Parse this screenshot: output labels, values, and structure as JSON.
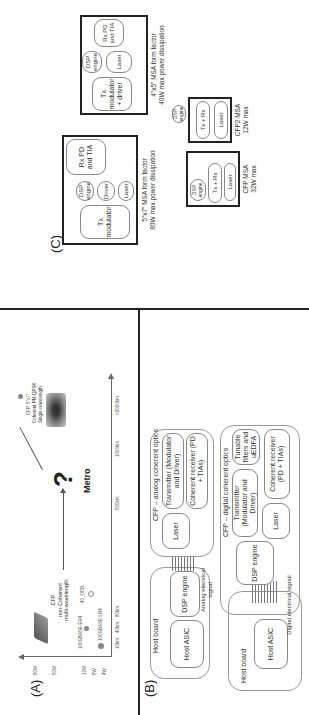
{
  "panels": {
    "a": {
      "label": "(A)",
      "y_ticks": [
        "80W",
        "50W",
        "12W",
        "8W",
        "4W"
      ],
      "x_ticks": [
        "10km",
        "40km",
        "80km",
        "500km",
        "1000km",
        ">2000km"
      ],
      "points": {
        "cfp_noncoherent": "CFP\nnon-Coherent\nmulti-wavelength",
        "lr4_100g": "100GBASE-LR4",
        "er4_100g": "100GBASE-ER4",
        "ocb": "40_OCB",
        "cfp_coherent_a": "CFP, 5\"x7\"",
        "cfp_coherent_b": "Coherent PM-QPSK",
        "cfp_coherent_c": "Single-wavelength"
      },
      "question_mark": "?",
      "metro_label": "Metro"
    },
    "b": {
      "label": "(B)",
      "analog": {
        "host_board": "Host board",
        "host_asic": "Host ASIC",
        "dsp_engine": "DSP engine",
        "signal": "Analog electrical signal",
        "module_title": "CFP – analog coherent optics",
        "laser": "Laser",
        "transmitter": "Transmitter (Modulator and Driver)",
        "receiver": "Coherent receiver (PD + TIAs)"
      },
      "digital": {
        "host_board": "Host board",
        "host_asic": "Host ASIC",
        "signal": "Digital electrical signal",
        "module_title": "CFP – digital coherent optics",
        "dsp_engine": "DSP engine",
        "transmitter": "Transmitter (Modulator and Driver)",
        "laser": "Laser",
        "tunable": "Tunable filters and uEDFA",
        "receiver": "Coherent receiver (PD + TIAs)"
      }
    },
    "c": {
      "label": "(C)",
      "msa_5x7": {
        "tx": "Tx modulator",
        "dsp": "DSP engine",
        "driver": "Driver",
        "laser": "Laser",
        "rx": "Rx PD and TIA",
        "caption_1": "5\"x7\" MSA form factor",
        "caption_2": "80W max power dissipation"
      },
      "msa_4x5": {
        "tx": "Tx modulator + driver",
        "dsp": "DSP engine",
        "laser": "Laser",
        "rx": "Rx PD and TIA",
        "caption_1": "4\"x5\" MSA form factor",
        "caption_2": "40W max power dissipation"
      },
      "cfp": {
        "dsp": "DSP engine",
        "txrx": "Tx + Rx",
        "laser": "Laser",
        "caption_1": "CFP MSA",
        "caption_2": "32W max"
      },
      "cfp2": {
        "dsp": "DSP engine",
        "txrx": "Tx + Rx",
        "laser": "Laser",
        "caption_1": "CFP2 MSA",
        "caption_2": "12W max"
      }
    }
  }
}
